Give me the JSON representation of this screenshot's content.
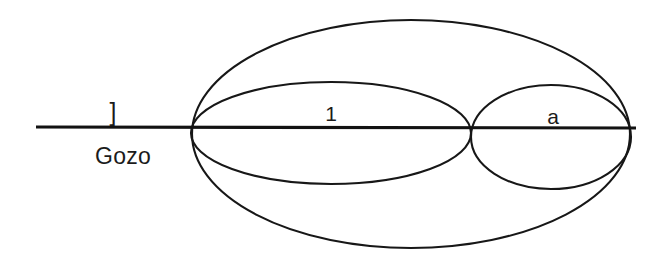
{
  "figure": {
    "type": "diagram",
    "background_color": "#ffffff",
    "stroke_color": "#171717",
    "labels": {
      "bracket": "]",
      "caption": "Gozo",
      "inner_left": "1",
      "inner_right": "a"
    },
    "geometry": {
      "axis": {
        "name": "horizontal-axis-line",
        "x1": 36,
        "y1": 127,
        "x2": 636,
        "y2": 128
      },
      "outer_ellipse": {
        "name": "outer-ellipse",
        "cx": 411,
        "cy": 134,
        "rx": 219,
        "ry": 114
      },
      "inner_left_ellipse": {
        "name": "inner-left-ellipse",
        "cx": 331,
        "cy": 133,
        "rx": 140,
        "ry": 51
      },
      "inner_right_ellipse": {
        "name": "inner-right-ellipse",
        "cx": 551,
        "cy": 137,
        "rx": 80,
        "ry": 52
      },
      "vertices": {
        "left": {
          "x": 192,
          "y": 127
        },
        "middle": {
          "x": 471,
          "y": 128
        },
        "right": {
          "x": 631,
          "y": 128
        }
      }
    }
  }
}
